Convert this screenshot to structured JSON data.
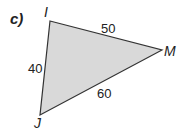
{
  "part_label": "c)",
  "triangle": {
    "vertices": {
      "I": {
        "label": "I"
      },
      "M": {
        "label": "M"
      },
      "J": {
        "label": "J"
      }
    },
    "sides": {
      "IM": "50",
      "IJ": "40",
      "JM": "60"
    },
    "fill": "#d8d8d8",
    "stroke": "#333333"
  }
}
